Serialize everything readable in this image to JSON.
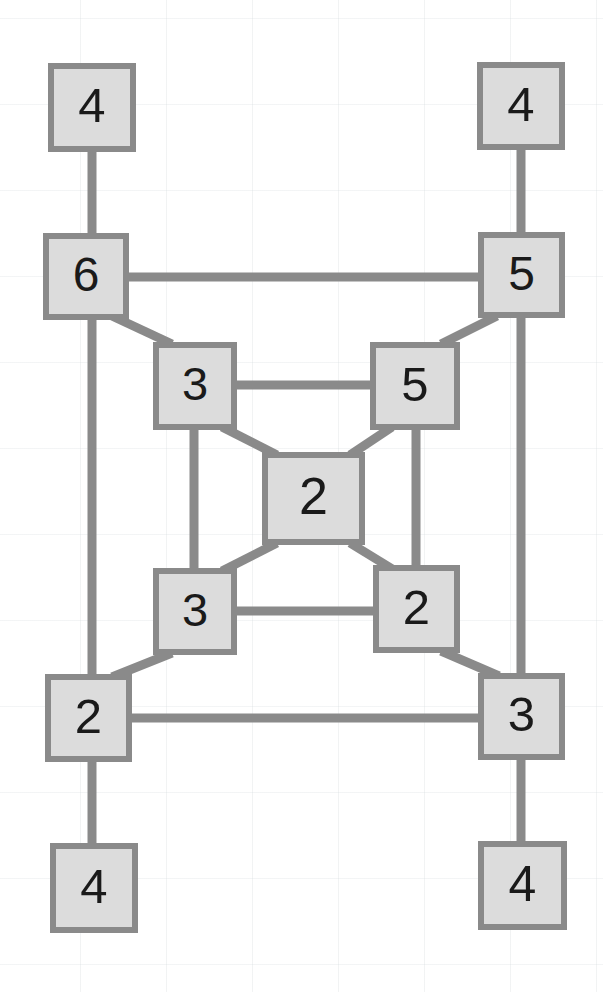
{
  "figure": {
    "type": "node-link-diagram",
    "title": "",
    "background_color": "#ffffff",
    "node_fill_color": "#dcdcdc",
    "node_border_color": "#8a8a8a",
    "edge_color": "#8a8a8a",
    "label_color": "#1a1a1a",
    "node_border_width": 6,
    "edge_width": 9,
    "node_count": 13,
    "edge_count": 20
  },
  "nodes": [
    {
      "id": "n0",
      "label": "4",
      "x": 48,
      "y": 63,
      "w": 88,
      "h": 89,
      "role": "top-left-leaf"
    },
    {
      "id": "n1",
      "label": "4",
      "x": 477,
      "y": 62,
      "w": 88,
      "h": 88,
      "role": "top-right-leaf"
    },
    {
      "id": "n2",
      "label": "6",
      "x": 43,
      "y": 233,
      "w": 86,
      "h": 87,
      "role": "upper-left-hub"
    },
    {
      "id": "n3",
      "label": "5",
      "x": 478,
      "y": 232,
      "w": 87,
      "h": 86,
      "role": "upper-right-hub"
    },
    {
      "id": "n4",
      "label": "3",
      "x": 153,
      "y": 342,
      "w": 84,
      "h": 88,
      "role": "inner-top-left"
    },
    {
      "id": "n5",
      "label": "5",
      "x": 370,
      "y": 342,
      "w": 90,
      "h": 88,
      "role": "inner-top-right"
    },
    {
      "id": "n6",
      "label": "2",
      "x": 262,
      "y": 452,
      "w": 103,
      "h": 93,
      "role": "center"
    },
    {
      "id": "n7",
      "label": "3",
      "x": 153,
      "y": 568,
      "w": 84,
      "h": 87,
      "role": "inner-bottom-left"
    },
    {
      "id": "n8",
      "label": "2",
      "x": 373,
      "y": 565,
      "w": 87,
      "h": 88,
      "role": "inner-bottom-right"
    },
    {
      "id": "n9",
      "label": "2",
      "x": 45,
      "y": 674,
      "w": 87,
      "h": 88,
      "role": "lower-left-hub"
    },
    {
      "id": "n10",
      "label": "3",
      "x": 478,
      "y": 673,
      "w": 87,
      "h": 87,
      "role": "lower-right-hub"
    },
    {
      "id": "n11",
      "label": "4",
      "x": 50,
      "y": 843,
      "w": 88,
      "h": 90,
      "role": "bottom-left-leaf"
    },
    {
      "id": "n12",
      "label": "4",
      "x": 478,
      "y": 841,
      "w": 89,
      "h": 89,
      "role": "bottom-right-leaf"
    }
  ],
  "edges": [
    {
      "from": "n0",
      "to": "n2",
      "kind": "vertical",
      "path": "92,150 92,236"
    },
    {
      "from": "n1",
      "to": "n3",
      "kind": "vertical",
      "path": "521,148 521,234"
    },
    {
      "from": "n2",
      "to": "n3",
      "kind": "horizontal",
      "path": "127,277 480,277"
    },
    {
      "from": "n2",
      "to": "n9",
      "kind": "vertical",
      "path": "92,318 92,676"
    },
    {
      "from": "n3",
      "to": "n10",
      "kind": "vertical",
      "path": "521,316 521,675"
    },
    {
      "from": "n2",
      "to": "n4",
      "kind": "diagonal",
      "path": "112,316 172,344"
    },
    {
      "from": "n3",
      "to": "n5",
      "kind": "diagonal",
      "path": "497,316 441,344"
    },
    {
      "from": "n4",
      "to": "n5",
      "kind": "horizontal",
      "path": "235,385 372,385"
    },
    {
      "from": "n4",
      "to": "n7",
      "kind": "vertical",
      "path": "194,428 194,570"
    },
    {
      "from": "n5",
      "to": "n8",
      "kind": "vertical",
      "path": "416,428 416,567"
    },
    {
      "from": "n4",
      "to": "n6",
      "kind": "diagonal",
      "path": "222,427 277,455"
    },
    {
      "from": "n5",
      "to": "n6",
      "kind": "diagonal",
      "path": "392,427 350,455"
    },
    {
      "from": "n6",
      "to": "n7",
      "kind": "diagonal",
      "path": "277,543 222,571"
    },
    {
      "from": "n6",
      "to": "n8",
      "kind": "diagonal",
      "path": "350,543 394,570"
    },
    {
      "from": "n7",
      "to": "n8",
      "kind": "horizontal",
      "path": "235,611 375,611"
    },
    {
      "from": "n7",
      "to": "n9",
      "kind": "diagonal",
      "path": "172,653 112,677"
    },
    {
      "from": "n8",
      "to": "n10",
      "kind": "diagonal",
      "path": "441,651 499,676"
    },
    {
      "from": "n9",
      "to": "n10",
      "kind": "horizontal",
      "path": "130,718 480,718"
    },
    {
      "from": "n9",
      "to": "n11",
      "kind": "vertical",
      "path": "92,760 92,845"
    },
    {
      "from": "n10",
      "to": "n12",
      "kind": "vertical",
      "path": "521,758 521,843"
    }
  ],
  "chart_data": {
    "type": "diagram",
    "title": "",
    "node_labels": [
      "4",
      "4",
      "6",
      "5",
      "3",
      "5",
      "2",
      "3",
      "2",
      "2",
      "3",
      "4",
      "4"
    ],
    "values": [
      4,
      4,
      6,
      5,
      3,
      5,
      2,
      3,
      2,
      2,
      3,
      4,
      4
    ],
    "adjacency": [
      [
        "4",
        "6"
      ],
      [
        "4",
        "5"
      ],
      [
        "6",
        "5"
      ],
      [
        "6",
        "2"
      ],
      [
        "5",
        "3"
      ],
      [
        "6",
        "3"
      ],
      [
        "5",
        "5"
      ],
      [
        "3",
        "5"
      ],
      [
        "3",
        "3"
      ],
      [
        "5",
        "2"
      ],
      [
        "3",
        "2"
      ],
      [
        "5",
        "2"
      ],
      [
        "2",
        "3"
      ],
      [
        "2",
        "2"
      ],
      [
        "3",
        "2"
      ],
      [
        "3",
        "2"
      ],
      [
        "2",
        "3"
      ],
      [
        "2",
        "3"
      ],
      [
        "2",
        "4"
      ],
      [
        "3",
        "4"
      ]
    ]
  }
}
